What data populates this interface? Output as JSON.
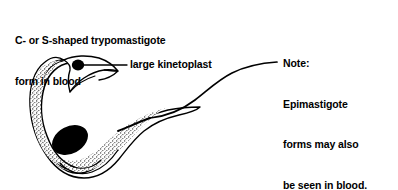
{
  "figure": {
    "background_color": "#ffffff",
    "ink_color": "#000000",
    "title": {
      "line1": "C- or S-shaped trypomastigote",
      "line2": "form in blood"
    },
    "note": {
      "line1": "Note:",
      "line2": "Epimastigote",
      "line3": "forms may also",
      "line4": "be seen in blood."
    },
    "callout": {
      "label": "large kinetoplast"
    },
    "organism": {
      "name": "trypomastigote",
      "parts": [
        "undulating-membrane",
        "kinetoplast",
        "nucleus",
        "cell-body",
        "flagellum"
      ]
    }
  }
}
